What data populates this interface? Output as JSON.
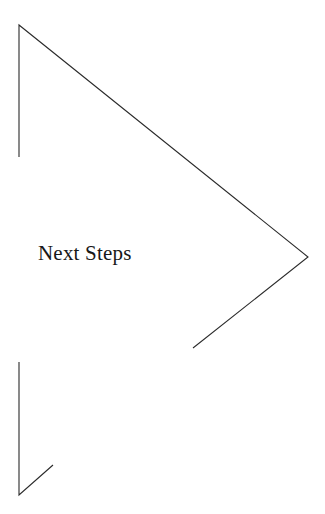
{
  "page": {
    "width": 325,
    "height": 514,
    "background_color": "#ffffff"
  },
  "caption": {
    "text": "Next Steps",
    "color": "#181818",
    "font_size_px": 21,
    "x": 38,
    "y": 240
  },
  "figure": {
    "kind": "line-drawing",
    "stroke_color": "#2b2b2b",
    "stroke_width": 1.1,
    "shapes": [
      {
        "name": "upper-chevron-outline",
        "points": [
          [
            19,
            157
          ],
          [
            19,
            25
          ],
          [
            308,
            257
          ],
          [
            193,
            348
          ]
        ]
      },
      {
        "name": "lower-arrow-outline",
        "points": [
          [
            19,
            362
          ],
          [
            19,
            495
          ],
          [
            53,
            465
          ]
        ]
      }
    ]
  }
}
